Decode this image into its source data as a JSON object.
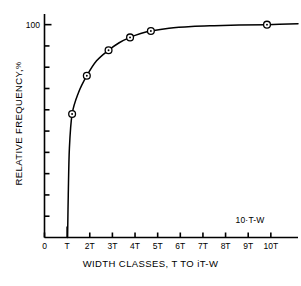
{
  "chart_data": {
    "type": "line",
    "title": "",
    "xlabel": "WIDTH CLASSES, T TO iT-W",
    "ylabel": "RELATIVE FREQUENCY, %",
    "ylabel_main": "RELATIVE  FREQUENCY,",
    "ylabel_unit": "%",
    "xlim": [
      0,
      11.2
    ],
    "ylim": [
      0,
      105
    ],
    "grid": false,
    "legend": null,
    "x_tick_labels": [
      "0",
      "T",
      "2T",
      "3T",
      "4T",
      "5T",
      "6T",
      "7T",
      "8T",
      "9T",
      "10T"
    ],
    "x_tick_values": [
      0,
      1,
      2,
      3,
      4,
      5,
      6,
      7,
      8,
      9,
      10
    ],
    "y_tick_labels": [
      "100",
      "",
      "",
      "",
      "",
      "",
      "",
      "",
      "",
      ""
    ],
    "y_tick_values": [
      100,
      90,
      80,
      70,
      60,
      50,
      40,
      30,
      20,
      10
    ],
    "y_axis_max_label": "100",
    "annotations": [
      {
        "text": "10·T-W",
        "x": 9.5,
        "y": 6
      }
    ],
    "series": [
      {
        "name": "cumulative relative frequency",
        "marker": "circle-dot",
        "x": [
          1.22,
          1.87,
          2.83,
          3.78,
          4.7,
          9.83
        ],
        "values": [
          58,
          76,
          88,
          94,
          97,
          100
        ]
      }
    ],
    "curve_path_x": [
      1.02,
      1.05,
      1.1,
      1.22,
      1.5,
      1.87,
      2.3,
      2.83,
      3.3,
      3.78,
      4.25,
      4.7,
      5.5,
      6.5,
      7.5,
      8.6,
      9.83,
      11.2
    ],
    "curve_path_y": [
      0,
      20,
      42,
      58,
      68,
      76,
      83,
      88,
      91.5,
      94,
      95.8,
      97,
      98.3,
      99.1,
      99.5,
      99.8,
      100,
      100.4
    ]
  },
  "figure": {
    "background_color": "#ffffff",
    "line_color": "#000000",
    "axis_color": "#000000",
    "marker_fill": "#ffffff"
  }
}
